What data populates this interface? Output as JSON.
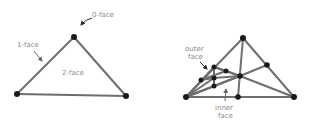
{
  "left_diagram": {
    "title": "simplex faces",
    "labels": {
      "zero_face": "0-face",
      "one_face": "1-face",
      "two_face": "2-face"
    },
    "vertices": [
      {
        "x": 74,
        "y": 37
      },
      {
        "x": 17,
        "y": 94
      },
      {
        "x": 126,
        "y": 96
      }
    ]
  },
  "right_diagram": {
    "labels": {
      "outer_face_line1": "outer",
      "outer_face_line2": "face",
      "inner_face_line1": "inner",
      "inner_face_line2": "face"
    },
    "vertices": [
      {
        "x": 243,
        "y": 38
      },
      {
        "x": 267,
        "y": 65
      },
      {
        "x": 240,
        "y": 76
      },
      {
        "x": 186,
        "y": 97
      },
      {
        "x": 238,
        "y": 97
      },
      {
        "x": 294,
        "y": 97
      },
      {
        "x": 214,
        "y": 67
      },
      {
        "x": 226,
        "y": 71
      },
      {
        "x": 201,
        "y": 80
      },
      {
        "x": 214,
        "y": 78
      },
      {
        "x": 214,
        "y": 86
      }
    ]
  },
  "colors": {
    "edge": "#6e6e6e",
    "vertex": "#1a1a1a",
    "label": "#8a8a8a",
    "background": "#ffffff"
  }
}
